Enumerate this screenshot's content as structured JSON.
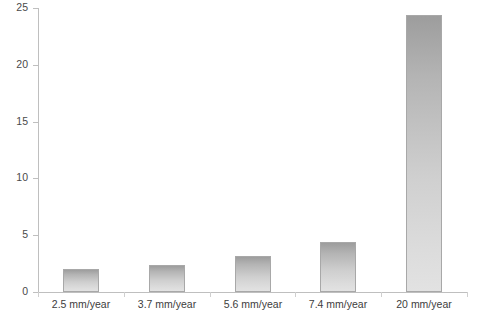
{
  "chart_data": {
    "type": "bar",
    "title": "",
    "xlabel": "",
    "ylabel": "",
    "categories": [
      "2.5 mm/year",
      "3.7 mm/year",
      "5.6 mm/year",
      "7.4 mm/year",
      "20 mm/year"
    ],
    "values": [
      2.0,
      2.4,
      3.2,
      4.4,
      24.4
    ],
    "ylim": [
      0,
      25
    ],
    "yticks": [
      0,
      5,
      10,
      15,
      20,
      25
    ],
    "ytick_labels": [
      "0",
      "5",
      "10",
      "15",
      "20",
      "25"
    ],
    "grid": false,
    "legend": null,
    "bar_color": "#c4c4c4",
    "bar_border_color": "#a8a8a8",
    "axis_color": "#bfbfbf",
    "text_color": "#3d3d3d"
  }
}
